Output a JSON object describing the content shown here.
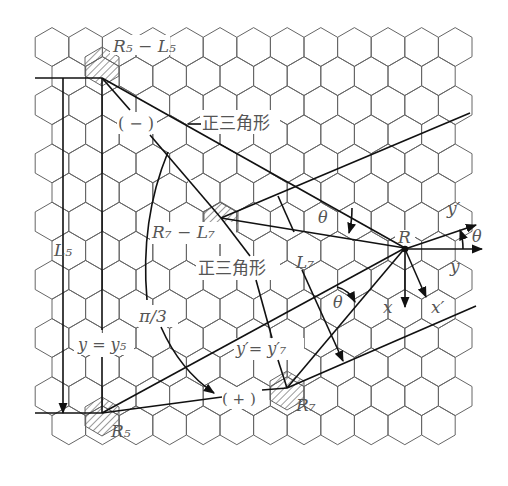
{
  "diagram": {
    "type": "hexagonal-lattice-geometry",
    "labels": {
      "r5_l5": "R₅ − L₅",
      "minus_sign": "( − )",
      "triangle_top": "正三角形",
      "r7_l7": "R₇ − L₇",
      "triangle_mid": "正三角形",
      "theta_upper": "θ",
      "theta_right": "θ",
      "theta_lower": "θ",
      "r_point": "R",
      "y_prime_axis": "y′",
      "y_axis": "y",
      "x_axis": "x",
      "x_prime_axis": "x′",
      "l5": "L₅",
      "l7": "L₇",
      "pi_over_3": "π/3",
      "y_eq_y5": "y = y₅",
      "y_prime_eq_y7": "y′= y′₇",
      "plus_sign": "( + )",
      "r5": "R₅",
      "r7": "R₇"
    },
    "colors": {
      "grid": "#666666",
      "lines": "#111111",
      "text": "#555555",
      "background": "#ffffff"
    }
  }
}
